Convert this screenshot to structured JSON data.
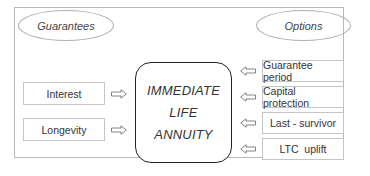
{
  "diagram": {
    "left_header": "Guarantees",
    "right_header": "Options",
    "center": {
      "lines": [
        "IMMEDIATE",
        "LIFE",
        "ANNUITY"
      ]
    },
    "guarantees": [
      {
        "label": "Interest"
      },
      {
        "label": "Longevity"
      }
    ],
    "options": [
      {
        "label": "Guarantee period"
      },
      {
        "label": "Capital protection"
      },
      {
        "label": "Last - survivor"
      },
      {
        "label": "LTC  uplift"
      }
    ],
    "icons": {
      "left_arrows": "arrow-right-outline-icon",
      "right_arrows": "arrow-left-outline-icon"
    },
    "colors": {
      "border_light": "#c4c4c4",
      "border_dark": "#222222",
      "text": "#333333"
    }
  }
}
